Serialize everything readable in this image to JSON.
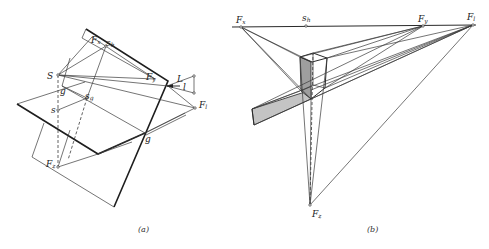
{
  "figure": {
    "panels": [
      {
        "id": "a",
        "caption": "(a)",
        "labels": {
          "S": "S",
          "Fx": "F",
          "Fx_sub": "x",
          "sh": "s",
          "sh_sub": "h",
          "Fy": "F",
          "Fy_sub": "y",
          "L": "L",
          "l": "l",
          "Fl": "F",
          "Fl_sub": "l",
          "g_upper": "g",
          "sg": "s",
          "sg_sub": "g",
          "s": "s",
          "g_lower": "g",
          "Fz": "F",
          "Fz_sub": "z"
        }
      },
      {
        "id": "b",
        "caption": "(b)",
        "labels": {
          "Fx": "F",
          "Fx_sub": "x",
          "sh": "s",
          "sh_sub": "h",
          "Fy": "F",
          "Fy_sub": "y",
          "Fl": "F",
          "Fl_sub": "l",
          "Fz": "F",
          "Fz_sub": "z"
        },
        "shade_color": "#bdbdbd",
        "shade_dark": "#9a9a9a"
      }
    ]
  }
}
